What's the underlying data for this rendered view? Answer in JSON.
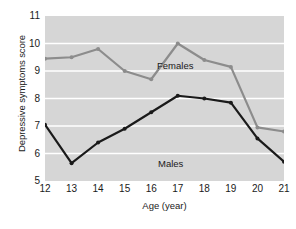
{
  "chart_data": {
    "type": "line",
    "title": "",
    "subtitle": "",
    "xlabel": "Age (year)",
    "ylabel": "Depressive symptoms score",
    "x": [
      12,
      13,
      14,
      15,
      16,
      17,
      18,
      19,
      20,
      21
    ],
    "xticklabels": [
      "12",
      "13",
      "14",
      "15",
      "16",
      "17",
      "18",
      "19",
      "20",
      "21"
    ],
    "yticklabels": [
      "5",
      "6",
      "7",
      "8",
      "9",
      "10",
      "11"
    ],
    "yticks": [
      5,
      6,
      7,
      8,
      9,
      10,
      11
    ],
    "xlim": [
      12,
      21
    ],
    "ylim": [
      5,
      11
    ],
    "grid": "horizontal-white-gridlines",
    "plot_background": "#d6d6d6",
    "legend": "inline-annotations",
    "legend_position": "in-plot",
    "series": [
      {
        "name": "Females",
        "color": "#8c8c8c",
        "marker": "circle",
        "values": [
          9.45,
          9.5,
          9.8,
          9.0,
          8.7,
          10.0,
          9.4,
          9.15,
          6.95,
          6.8
        ]
      },
      {
        "name": "Males",
        "color": "#1a1a1a",
        "marker": "circle",
        "values": [
          7.05,
          5.65,
          6.4,
          6.9,
          7.5,
          8.1,
          8.0,
          7.85,
          6.55,
          5.7
        ]
      }
    ]
  },
  "annotations": {
    "females_label": "Females",
    "males_label": "Males"
  },
  "colors": {
    "females_line": "#8c8c8c",
    "males_line": "#1a1a1a",
    "plot_bg": "#d6d6d6",
    "gridline": "#ffffff",
    "page_bg": "#ffffff",
    "text": "#1a1a1a"
  }
}
